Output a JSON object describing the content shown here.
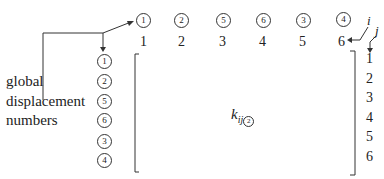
{
  "diagram": {
    "type": "stiffness-matrix-assembly",
    "label_lines": [
      "global",
      "displacement",
      "numbers"
    ],
    "column_global_numbers": [
      "1",
      "2",
      "5",
      "6",
      "3",
      "4"
    ],
    "column_local_numbers": [
      "1",
      "2",
      "3",
      "4",
      "5",
      "6"
    ],
    "row_global_numbers": [
      "1",
      "2",
      "5",
      "6",
      "3",
      "4"
    ],
    "row_local_numbers": [
      "1",
      "2",
      "3",
      "4",
      "5",
      "6"
    ],
    "index_i": "i",
    "index_j": "j",
    "matrix_symbol": {
      "base": "k",
      "subscript": "ij",
      "element_number": "2"
    }
  }
}
